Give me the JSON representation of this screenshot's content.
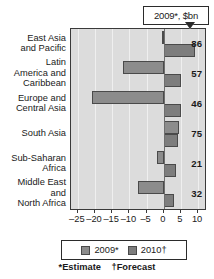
{
  "callout": {
    "text": "2009*, $bn"
  },
  "axis": {
    "ticks": [
      "–25",
      "–20",
      "–15",
      "–10",
      "–5",
      "0",
      "5",
      "10"
    ]
  },
  "legend": {
    "items": [
      {
        "label": "2009*",
        "color": "#8c8c8c"
      },
      {
        "label": "2010†",
        "color": "#7d7d7d"
      }
    ]
  },
  "footnote": {
    "estimate": "*Estimate",
    "forecast": "†Forecast"
  },
  "categories": [
    {
      "lines": [
        "East Asia",
        "and Pacific"
      ],
      "value_label": "86"
    },
    {
      "lines": [
        "Latin",
        "America and",
        "Caribbean"
      ],
      "value_label": "57"
    },
    {
      "lines": [
        "Europe and",
        "Central Asia"
      ],
      "value_label": "46"
    },
    {
      "lines": [
        "South Asia"
      ],
      "value_label": "75"
    },
    {
      "lines": [
        "Sub-Saharan",
        "Africa"
      ],
      "value_label": "21"
    },
    {
      "lines": [
        "Middle East",
        "and",
        "North Africa"
      ],
      "value_label": "32"
    }
  ],
  "chart_data": {
    "type": "bar",
    "orientation": "horizontal",
    "title": "2009*, $bn",
    "xlabel": "",
    "ylabel": "",
    "xlim": [
      -27,
      12
    ],
    "grid": true,
    "legend_position": "bottom",
    "categories": [
      "East Asia and Pacific",
      "Latin America and Caribbean",
      "Europe and Central Asia",
      "South Asia",
      "Sub-Saharan Africa",
      "Middle East and North Africa"
    ],
    "value_labels": [
      86,
      57,
      46,
      75,
      21,
      32
    ],
    "series": [
      {
        "name": "2009*",
        "color": "#8c8c8c",
        "values": [
          -0.5,
          -12,
          -21,
          4.5,
          -2,
          -7.5
        ]
      },
      {
        "name": "2010†",
        "color": "#7d7d7d",
        "values": [
          9,
          5,
          5,
          4,
          3.5,
          3
        ]
      }
    ],
    "xticks": [
      -25,
      -20,
      -15,
      -10,
      -5,
      0,
      5,
      10
    ],
    "annotations": [
      "*Estimate",
      "†Forecast"
    ]
  }
}
